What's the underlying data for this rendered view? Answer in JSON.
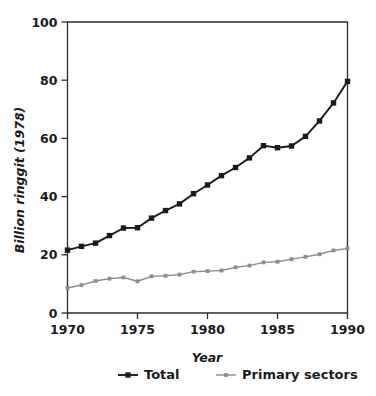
{
  "chart_data": {
    "type": "line",
    "title": "",
    "xlabel": "Year",
    "ylabel": "Billion ringgit (1978)",
    "xlim": [
      1970,
      1990
    ],
    "ylim": [
      0,
      100
    ],
    "grid": false,
    "legend_position": "bottom",
    "x_ticks": [
      "1970",
      "1975",
      "1980",
      "1985",
      "1990"
    ],
    "x_tick_values": [
      1970,
      1975,
      1980,
      1985,
      1990
    ],
    "y_ticks": [
      "0",
      "20",
      "40",
      "60",
      "80",
      "100"
    ],
    "y_tick_values": [
      0,
      20,
      40,
      60,
      80,
      100
    ],
    "x": [
      1970,
      1971,
      1972,
      1973,
      1974,
      1975,
      1976,
      1977,
      1978,
      1979,
      1980,
      1981,
      1982,
      1983,
      1984,
      1985,
      1986,
      1987,
      1988,
      1989,
      1990
    ],
    "series": [
      {
        "name": "Total",
        "color": "#1a1a1a",
        "marker": "square",
        "values": [
          21.6,
          22.9,
          24.0,
          26.6,
          29.2,
          29.3,
          32.6,
          35.2,
          37.5,
          41.0,
          44.0,
          47.2,
          50.0,
          53.3,
          57.5,
          56.8,
          57.4,
          60.7,
          66.0,
          72.2,
          79.6
        ]
      },
      {
        "name": "Primary sectors",
        "color": "#8c8c8c",
        "marker": "square-small",
        "values": [
          8.6,
          9.6,
          11.0,
          11.8,
          12.2,
          10.9,
          12.6,
          12.8,
          13.2,
          14.2,
          14.4,
          14.6,
          15.7,
          16.3,
          17.4,
          17.6,
          18.5,
          19.3,
          20.2,
          21.5,
          22.2
        ]
      }
    ],
    "legend": [
      {
        "label": "Total",
        "color": "#1a1a1a",
        "marker": "square"
      },
      {
        "label": "Primary sectors",
        "color": "#8c8c8c",
        "marker": "square-small"
      }
    ]
  }
}
